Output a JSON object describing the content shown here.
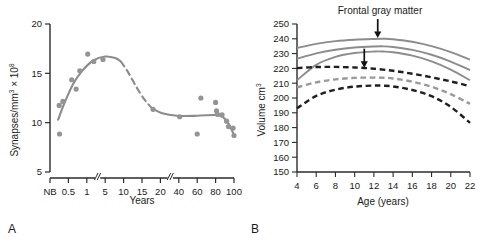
{
  "figure": {
    "panels": [
      {
        "letter": "A",
        "title": "",
        "xlabel": "Years",
        "ylabel_main": "Synapses/mm",
        "ylabel_sup1": "3",
        "ylabel_mid": " × 10",
        "ylabel_sup2": "8"
      },
      {
        "letter": "B",
        "title": "Frontal gray matter",
        "xlabel": "Age (years)",
        "ylabel_main": "Volume cm",
        "ylabel_sup1": "3"
      }
    ]
  },
  "colors": {
    "gray_curve": "#8c8c8c",
    "gray_point": "#949494",
    "gray_dashed": "#9a9a9a",
    "dark_dashed": "#1f1f1f",
    "axis": "#2b2b2b",
    "text": "#1a1a1a",
    "background": "#ffffff"
  },
  "chart_data": [
    {
      "id": "panel-a",
      "type": "scatter",
      "title": "",
      "xlabel": "Years",
      "ylabel": "Synapses/mm3 x 10^8",
      "ylim": [
        5,
        20
      ],
      "yticks": [
        5,
        10,
        15,
        20
      ],
      "xtick_labels": [
        "NB",
        "0.5",
        "1",
        "5",
        "10",
        "15",
        "20",
        "40",
        "60",
        "80",
        "100"
      ],
      "xtick_positions": [
        0,
        1,
        2,
        3,
        4,
        5,
        6,
        7,
        8,
        9,
        10
      ],
      "axis_breaks": [
        2.5,
        6.45
      ],
      "grid": false,
      "legend": "none",
      "points": [
        {
          "x": 0.52,
          "y": 8.85
        },
        {
          "x": 0.5,
          "y": 11.75
        },
        {
          "x": 0.7,
          "y": 12.15
        },
        {
          "x": 1.18,
          "y": 14.35
        },
        {
          "x": 1.42,
          "y": 13.4
        },
        {
          "x": 1.62,
          "y": 15.25
        },
        {
          "x": 2.05,
          "y": 16.95
        },
        {
          "x": 2.38,
          "y": 16.2
        },
        {
          "x": 2.88,
          "y": 16.4
        },
        {
          "x": 5.6,
          "y": 11.35
        },
        {
          "x": 7.05,
          "y": 10.6
        },
        {
          "x": 8.0,
          "y": 8.85
        },
        {
          "x": 8.2,
          "y": 12.5
        },
        {
          "x": 9.0,
          "y": 12.05
        },
        {
          "x": 9.05,
          "y": 11.2
        },
        {
          "x": 9.1,
          "y": 10.85
        },
        {
          "x": 9.35,
          "y": 10.8
        },
        {
          "x": 9.6,
          "y": 10.15
        },
        {
          "x": 9.7,
          "y": 9.6
        },
        {
          "x": 9.95,
          "y": 9.45
        },
        {
          "x": 10.0,
          "y": 8.7
        }
      ],
      "curve_solid_left": [
        {
          "x": 0.44,
          "y": 10.3
        },
        {
          "x": 0.8,
          "y": 12.05
        },
        {
          "x": 1.25,
          "y": 13.9
        },
        {
          "x": 1.75,
          "y": 15.25
        },
        {
          "x": 2.35,
          "y": 16.3
        },
        {
          "x": 3.0,
          "y": 16.7
        },
        {
          "x": 3.55,
          "y": 16.55
        },
        {
          "x": 3.85,
          "y": 16.2
        }
      ],
      "curve_dashed_mid": [
        {
          "x": 3.85,
          "y": 16.2
        },
        {
          "x": 4.25,
          "y": 15.1
        },
        {
          "x": 4.7,
          "y": 13.6
        },
        {
          "x": 5.15,
          "y": 12.3
        },
        {
          "x": 5.55,
          "y": 11.45
        }
      ],
      "curve_solid_right": [
        {
          "x": 5.55,
          "y": 11.45
        },
        {
          "x": 6.1,
          "y": 10.95
        },
        {
          "x": 6.9,
          "y": 10.7
        },
        {
          "x": 8.0,
          "y": 10.7
        },
        {
          "x": 9.0,
          "y": 10.78
        },
        {
          "x": 9.4,
          "y": 10.55
        },
        {
          "x": 9.7,
          "y": 9.9
        },
        {
          "x": 10.0,
          "y": 8.75
        }
      ]
    },
    {
      "id": "panel-b",
      "type": "line",
      "title": "Frontal gray matter",
      "xlabel": "Age (years)",
      "ylabel": "Volume cm3",
      "xlim": [
        4,
        22
      ],
      "ylim": [
        150,
        250
      ],
      "xticks": [
        4,
        6,
        8,
        10,
        12,
        14,
        16,
        18,
        20,
        22
      ],
      "yticks": [
        150,
        160,
        170,
        180,
        190,
        200,
        210,
        220,
        230,
        240,
        250
      ],
      "grid": false,
      "legend": "none",
      "annotations": [
        {
          "label": "arrow-peak-upper",
          "x": 12.4,
          "y": 240.5
        },
        {
          "label": "arrow-peak-lower",
          "x": 11.0,
          "y": 220.5
        }
      ],
      "series": [
        {
          "name": "male-upper-solid",
          "style": "solid",
          "color": "gray_curve",
          "points": [
            {
              "x": 4,
              "y": 233.8
            },
            {
              "x": 6,
              "y": 236.6
            },
            {
              "x": 8,
              "y": 238.4
            },
            {
              "x": 10,
              "y": 239.4
            },
            {
              "x": 12,
              "y": 239.9
            },
            {
              "x": 13,
              "y": 240.0
            },
            {
              "x": 14,
              "y": 239.7
            },
            {
              "x": 16,
              "y": 238.0
            },
            {
              "x": 18,
              "y": 235.0
            },
            {
              "x": 20,
              "y": 231.0
            },
            {
              "x": 22,
              "y": 226.0
            }
          ]
        },
        {
          "name": "male-mid-solid",
          "style": "solid",
          "color": "gray_curve",
          "points": [
            {
              "x": 4,
              "y": 226.5
            },
            {
              "x": 6,
              "y": 230.2
            },
            {
              "x": 8,
              "y": 232.6
            },
            {
              "x": 10,
              "y": 234.1
            },
            {
              "x": 12,
              "y": 234.8
            },
            {
              "x": 13,
              "y": 234.9
            },
            {
              "x": 14,
              "y": 234.5
            },
            {
              "x": 16,
              "y": 232.5
            },
            {
              "x": 18,
              "y": 229.2
            },
            {
              "x": 20,
              "y": 224.6
            },
            {
              "x": 22,
              "y": 218.8
            }
          ]
        },
        {
          "name": "male-lower-solid",
          "style": "solid",
          "color": "gray_curve",
          "points": [
            {
              "x": 4,
              "y": 212.0
            },
            {
              "x": 6,
              "y": 222.4
            },
            {
              "x": 8,
              "y": 227.8
            },
            {
              "x": 10,
              "y": 230.4
            },
            {
              "x": 12,
              "y": 231.4
            },
            {
              "x": 13,
              "y": 231.4
            },
            {
              "x": 14,
              "y": 230.9
            },
            {
              "x": 16,
              "y": 228.6
            },
            {
              "x": 18,
              "y": 224.8
            },
            {
              "x": 20,
              "y": 219.2
            },
            {
              "x": 22,
              "y": 212.0
            }
          ]
        },
        {
          "name": "female-upper-dashed",
          "style": "dashed",
          "color": "dark_dashed",
          "points": [
            {
              "x": 4,
              "y": 220.2
            },
            {
              "x": 6,
              "y": 220.9
            },
            {
              "x": 8,
              "y": 221.0
            },
            {
              "x": 10,
              "y": 220.6
            },
            {
              "x": 11,
              "y": 220.3
            },
            {
              "x": 12,
              "y": 219.8
            },
            {
              "x": 14,
              "y": 218.4
            },
            {
              "x": 16,
              "y": 216.4
            },
            {
              "x": 18,
              "y": 214.0
            },
            {
              "x": 20,
              "y": 211.2
            },
            {
              "x": 22,
              "y": 208.0
            }
          ]
        },
        {
          "name": "female-mid-dashed",
          "style": "dashed",
          "color": "gray_dashed",
          "points": [
            {
              "x": 4,
              "y": 207.2
            },
            {
              "x": 6,
              "y": 210.6
            },
            {
              "x": 8,
              "y": 212.6
            },
            {
              "x": 10,
              "y": 213.6
            },
            {
              "x": 12,
              "y": 213.8
            },
            {
              "x": 13,
              "y": 213.7
            },
            {
              "x": 14,
              "y": 213.2
            },
            {
              "x": 16,
              "y": 211.0
            },
            {
              "x": 18,
              "y": 207.6
            },
            {
              "x": 20,
              "y": 202.6
            },
            {
              "x": 22,
              "y": 196.0
            }
          ]
        },
        {
          "name": "female-lower-dashed",
          "style": "dashed",
          "color": "dark_dashed",
          "points": [
            {
              "x": 4,
              "y": 193.0
            },
            {
              "x": 6,
              "y": 201.4
            },
            {
              "x": 8,
              "y": 205.6
            },
            {
              "x": 10,
              "y": 207.7
            },
            {
              "x": 12,
              "y": 208.4
            },
            {
              "x": 13,
              "y": 208.3
            },
            {
              "x": 14,
              "y": 207.8
            },
            {
              "x": 16,
              "y": 205.4
            },
            {
              "x": 18,
              "y": 201.2
            },
            {
              "x": 20,
              "y": 194.0
            },
            {
              "x": 22,
              "y": 183.2
            }
          ]
        }
      ]
    }
  ]
}
